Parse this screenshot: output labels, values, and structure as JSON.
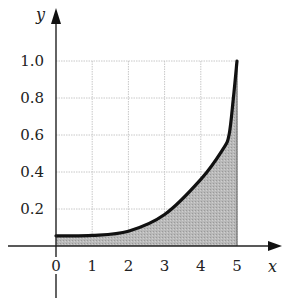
{
  "chart_data": {
    "type": "area",
    "title": "",
    "xlabel": "x",
    "ylabel": "y",
    "xlim": [
      0,
      5
    ],
    "ylim": [
      0,
      1.0
    ],
    "grid": true,
    "x_ticks": [
      "0",
      "1",
      "2",
      "3",
      "4",
      "5"
    ],
    "y_ticks": [
      "0.2",
      "0.4",
      "0.6",
      "0.8",
      "1.0"
    ],
    "series": [
      {
        "name": "curve",
        "x": [
          0,
          1,
          2,
          3,
          4,
          4.6,
          4.78,
          4.9,
          5
        ],
        "y": [
          0.055,
          0.057,
          0.08,
          0.17,
          0.36,
          0.52,
          0.6,
          0.8,
          1.0
        ],
        "fill": "shaded region under curve from x=0 to x=5"
      }
    ],
    "colors": {
      "curve": "#111111",
      "fill": "#b5b5b5",
      "grid": "#c8c8c8",
      "axis": "#222222"
    }
  }
}
